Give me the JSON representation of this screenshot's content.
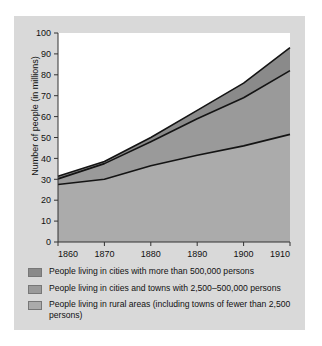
{
  "chart_data": {
    "type": "area",
    "stacked": true,
    "title": "",
    "xlabel": "",
    "ylabel": "Number of people (in millions)",
    "x": [
      1860,
      1870,
      1880,
      1890,
      1900,
      1910
    ],
    "xlim": [
      1860,
      1910
    ],
    "ylim": [
      0,
      100
    ],
    "xticks": [
      "1860",
      "1870",
      "1880",
      "1890",
      "1900",
      "1910"
    ],
    "yticks": [
      "0",
      "10",
      "20",
      "30",
      "40",
      "50",
      "60",
      "70",
      "80",
      "90",
      "100"
    ],
    "grid": false,
    "legend_position": "below",
    "series": [
      {
        "name": "People living in rural areas (including towns of fewer than 2,500 persons)",
        "color": "#ababab",
        "values": [
          27.5,
          30.0,
          36.5,
          41.5,
          46.0,
          51.5
        ],
        "cumulative_top": [
          27.5,
          30.0,
          36.5,
          41.5,
          46.0,
          51.5
        ]
      },
      {
        "name": "People living in cities and towns with 2,500–500,000 persons",
        "color": "#9a9a9a",
        "values": [
          2.7,
          7.5,
          11.5,
          17.5,
          23.0,
          30.5
        ],
        "cumulative_top": [
          30.2,
          37.5,
          48.0,
          59.0,
          69.0,
          82.0
        ]
      },
      {
        "name": "People living in cities with more than 500,000 persons",
        "color": "#8a8a8a",
        "values": [
          1.3,
          1.0,
          2.0,
          4.0,
          7.0,
          11.0
        ],
        "cumulative_top": [
          31.5,
          38.5,
          50.0,
          63.0,
          76.0,
          93.0
        ]
      }
    ]
  },
  "legend": {
    "items": [
      {
        "label": "People living in cities with more than 500,000 persons",
        "color": "#8a8a8a"
      },
      {
        "label": "People living in cities and towns with 2,500–500,000 persons",
        "color": "#9a9a9a"
      },
      {
        "label": "People living in rural areas (including towns of fewer than 2,500 persons)",
        "color": "#ababab"
      }
    ]
  }
}
